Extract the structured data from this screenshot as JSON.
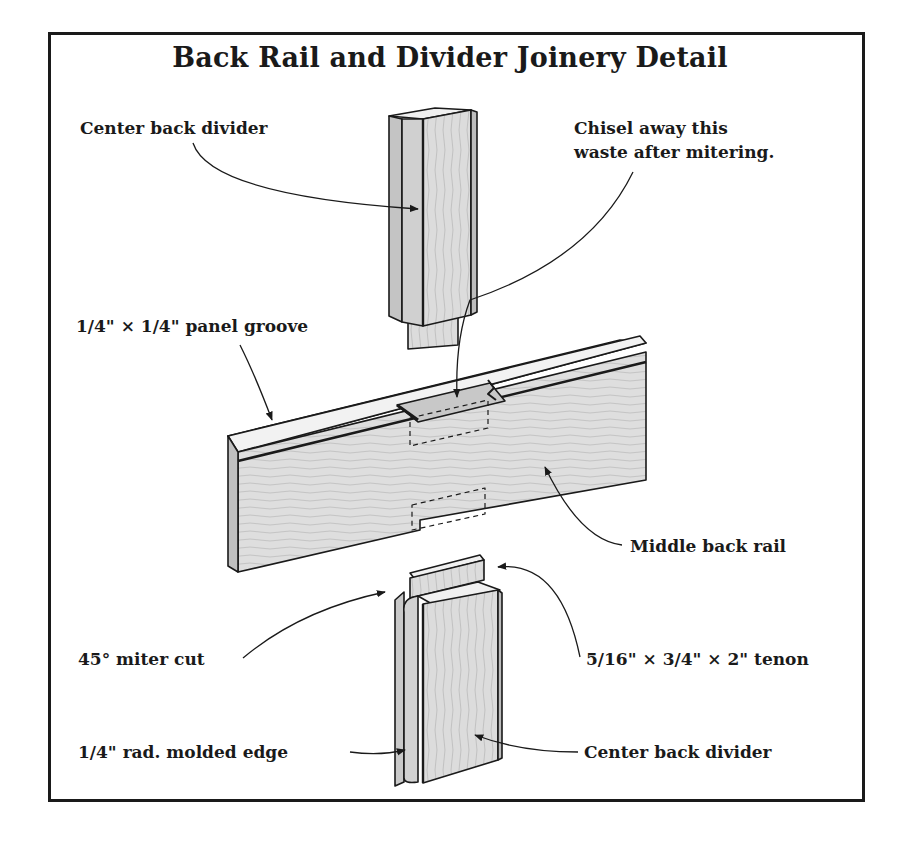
{
  "diagram": {
    "title": "Back Rail and Divider Joinery Detail",
    "colors": {
      "ink": "#1a1a1a",
      "wood_face": "#dedede",
      "wood_side": "#bdbdbd",
      "wood_top": "#f0f0f0",
      "background": "#ffffff"
    },
    "parts": [
      {
        "name": "Center back divider (upper)",
        "position": "top-center"
      },
      {
        "name": "Middle back rail",
        "position": "middle"
      },
      {
        "name": "Center back divider (lower)",
        "position": "bottom-center"
      }
    ],
    "labels": {
      "center_back_divider_top": "Center back divider",
      "chisel_line1": "Chisel away this",
      "chisel_line2": "waste after mitering.",
      "panel_groove": "1/4\" × 1/4\" panel groove",
      "middle_back_rail": "Middle back rail",
      "miter_cut": "45° miter cut",
      "tenon": "5/16\" × 3/4\" × 2\" tenon",
      "molded_edge": "1/4\" rad. molded edge",
      "center_back_divider_bottom": "Center back divider"
    }
  }
}
